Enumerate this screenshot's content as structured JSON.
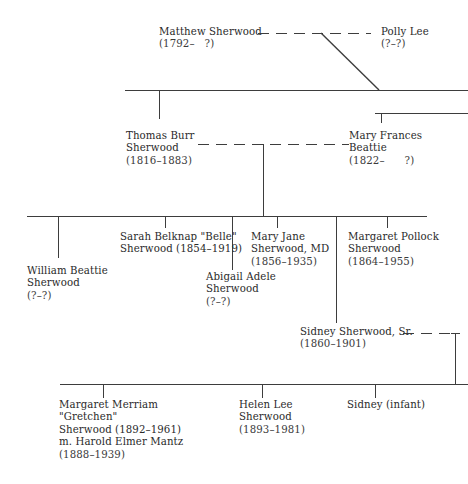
{
  "generation1": {
    "matthew": {
      "name": "Matthew Sherwood",
      "dates": "(1792–   ?)"
    },
    "polly": {
      "name": "Polly Lee",
      "dates": "(?–?)"
    }
  },
  "generation2": {
    "thomas": {
      "name_line1": "Thomas Burr",
      "name_line2": "Sherwood",
      "dates": "(1816–1883)"
    },
    "mary_frances": {
      "name_line1": "Mary Frances",
      "name_line2": "Beattie",
      "dates": "(1822–      ?)"
    }
  },
  "generation3": {
    "william": {
      "name_line1": "William Beattie",
      "name_line2": "Sherwood",
      "dates": "(?–?)"
    },
    "sarah": {
      "name_line1": "Sarah Belknap \"Belle\"",
      "name_line2": "Sherwood (1854–1919)"
    },
    "abigail": {
      "name_line1": "Abigail Adele",
      "name_line2": "Sherwood",
      "dates": "(?–?)"
    },
    "mary_jane": {
      "name_line1": "Mary Jane",
      "name_line2": "Sherwood, MD",
      "dates": "(1856–1935)"
    },
    "margaret_pollock": {
      "name_line1": "Margaret Pollock",
      "name_line2": "Sherwood",
      "dates": "(1864–1955)"
    },
    "sidney_sr": {
      "name": "Sidney Sherwood, Sr.",
      "dates": "(1860–1901)"
    }
  },
  "generation4": {
    "margaret_merriam": {
      "line1": "Margaret Merriam",
      "line2": "\"Gretchen\"",
      "line3": "Sherwood (1892–1961)",
      "line4": "m. Harold Elmer Mantz",
      "line5": "(1888–1939)"
    },
    "helen": {
      "name_line1": "Helen Lee",
      "name_line2": "Sherwood",
      "dates": "(1893–1981)"
    },
    "sidney_infant": {
      "name": "Sidney (infant)"
    }
  }
}
